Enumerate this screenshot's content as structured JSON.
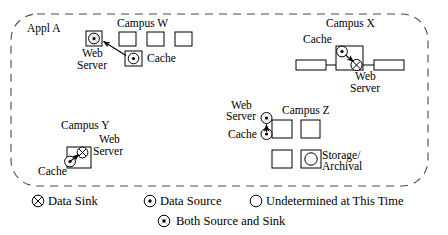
{
  "diagram": {
    "title_app": "Appl A",
    "campuses": [
      {
        "id": "campus-w",
        "label": "Campus W",
        "nodes": [
          {
            "name": "Web Server",
            "label_lines": [
              "Web",
              "Server"
            ],
            "symbol": "both-source-and-sink"
          },
          {
            "name": "Cache",
            "label_lines": [
              "Cache"
            ],
            "symbol": "data-source"
          }
        ],
        "plain_boxes": 3,
        "arrows": [
          {
            "from": "Cache",
            "to": "Web Server"
          }
        ]
      },
      {
        "id": "campus-x",
        "label": "Campus X",
        "nodes": [
          {
            "name": "Cache",
            "label_lines": [
              "Cache"
            ],
            "symbol": "data-source"
          },
          {
            "name": "Web Server",
            "label_lines": [
              "Web",
              "Server"
            ],
            "symbol": "data-sink"
          }
        ],
        "plain_boxes": 3,
        "arrows": [
          {
            "from": "Cache",
            "to": "Web Server"
          }
        ]
      },
      {
        "id": "campus-y",
        "label": "Campus Y",
        "nodes": [
          {
            "name": "Web Server",
            "label_lines": [
              "Web",
              "Server"
            ],
            "symbol": "data-sink"
          },
          {
            "name": "Cache",
            "label_lines": [
              "Cache"
            ],
            "symbol": "data-source"
          }
        ],
        "plain_boxes": 1,
        "arrows": [
          {
            "from": "Cache",
            "to": "Web Server"
          }
        ]
      },
      {
        "id": "campus-z",
        "label": "Campus Z",
        "nodes": [
          {
            "name": "Web Server",
            "label_lines": [
              "Web",
              "Server"
            ],
            "symbol": "both-source-and-sink"
          },
          {
            "name": "Cache",
            "label_lines": [
              "Cache"
            ],
            "symbol": "data-source"
          },
          {
            "name": "Storage/Archival",
            "label_lines": [
              "Storage/",
              "Archival"
            ],
            "symbol": "undetermined"
          }
        ],
        "plain_boxes": 4,
        "arrows": [
          {
            "from": "Cache",
            "to": "Web Server"
          }
        ]
      }
    ]
  },
  "labels": {
    "appl_a": "Appl A",
    "campus_w": "Campus W",
    "campus_x": "Campus X",
    "campus_y": "Campus Y",
    "campus_z": "Campus Z",
    "web": "Web",
    "server": "Server",
    "cache": "Cache",
    "storage": "Storage/",
    "archival": "Archival"
  },
  "legend": {
    "items": [
      {
        "symbol": "data-sink",
        "label": "Data Sink"
      },
      {
        "symbol": "data-source",
        "label": "Data Source"
      },
      {
        "symbol": "undetermined",
        "label": "Undetermined at This Time"
      },
      {
        "symbol": "both-source-and-sink",
        "label": "Both Source and Sink"
      }
    ]
  },
  "colors": {
    "stroke": "#000000",
    "background": "#ffffff",
    "boundary": "#555555"
  }
}
